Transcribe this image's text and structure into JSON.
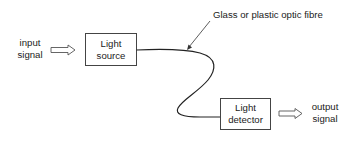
{
  "diagram": {
    "input": {
      "line1": "input",
      "line2": "signal"
    },
    "source_box": {
      "line1": "Light",
      "line2": "source"
    },
    "fibre_annotation": "Glass or plastic optic fibre",
    "detector_box": {
      "line1": "Light",
      "line2": "detector"
    },
    "output": {
      "line1": "output",
      "line2": "signal"
    },
    "colors": {
      "stroke": "#222222",
      "box_border": "#444444",
      "background": "#ffffff"
    }
  }
}
